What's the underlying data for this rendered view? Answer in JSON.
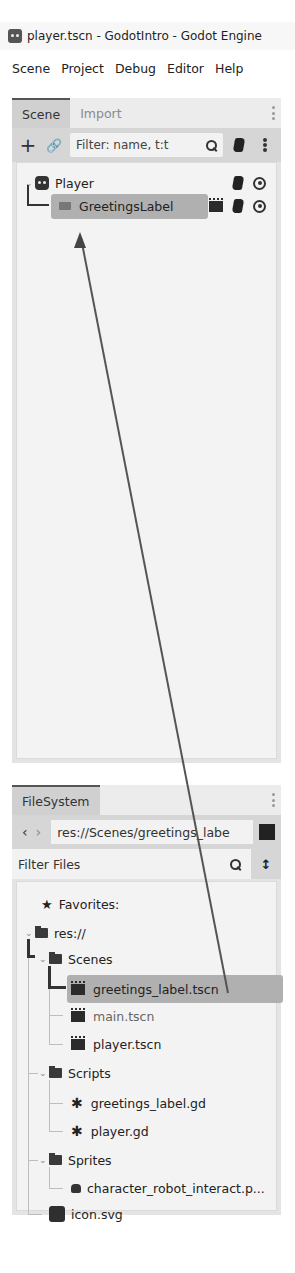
{
  "window": {
    "title": "player.tscn - GodotIntro - Godot Engine",
    "icon": "godot-logo-icon"
  },
  "menu": [
    "Scene",
    "Project",
    "Debug",
    "Editor",
    "Help"
  ],
  "scene_dock": {
    "tabs": [
      {
        "label": "Scene",
        "active": true
      },
      {
        "label": "Import",
        "active": false
      }
    ],
    "toolbar": {
      "add_icon": "+",
      "link_icon": "chain-link-icon",
      "filter_placeholder": "Filter: name, t:t",
      "script_icon": "attach-script-icon",
      "menu_icon": "kebab-icon"
    },
    "tree": [
      {
        "label": "Player",
        "type": "root",
        "expanded": true,
        "icons": [
          "script-icon",
          "visibility-icon"
        ]
      },
      {
        "label": "GreetingsLabel",
        "type": "child",
        "selected": true,
        "icons": [
          "instance-scene-icon",
          "script-icon",
          "visibility-icon"
        ]
      }
    ]
  },
  "filesystem_dock": {
    "tabs": [
      {
        "label": "FileSystem",
        "active": true
      }
    ],
    "nav": {
      "back": "‹",
      "forward": "›",
      "path": "res://Scenes/greetings_labe"
    },
    "filter_placeholder": "Filter Files",
    "tree": [
      {
        "label": "Favorites:",
        "icon": "star-icon",
        "depth": 0
      },
      {
        "label": "res://",
        "icon": "folder-icon",
        "depth": 0,
        "expanded": true
      },
      {
        "label": "Scenes",
        "icon": "folder-icon",
        "depth": 1,
        "expanded": true
      },
      {
        "label": "greetings_label.tscn",
        "icon": "scene-icon",
        "depth": 2,
        "selected": true
      },
      {
        "label": "main.tscn",
        "icon": "scene-icon",
        "depth": 2
      },
      {
        "label": "player.tscn",
        "icon": "scene-icon",
        "depth": 2
      },
      {
        "label": "Scripts",
        "icon": "folder-icon",
        "depth": 1,
        "expanded": true
      },
      {
        "label": "greetings_label.gd",
        "icon": "gear-icon",
        "depth": 2
      },
      {
        "label": "player.gd",
        "icon": "gear-icon",
        "depth": 2
      },
      {
        "label": "Sprites",
        "icon": "folder-icon",
        "depth": 1,
        "expanded": true
      },
      {
        "label": "character_robot_interact.p...",
        "icon": "image-icon",
        "depth": 2
      },
      {
        "label": "icon.svg",
        "icon": "svg-icon",
        "depth": 1
      }
    ]
  },
  "annotation": {
    "type": "drag-arrow",
    "from": "greetings_label.tscn",
    "to": "GreetingsLabel",
    "color": "#555555"
  }
}
